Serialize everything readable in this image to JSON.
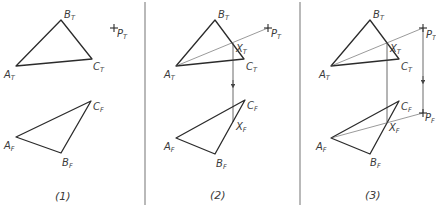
{
  "figure": {
    "panels": [
      {
        "caption": "(1)",
        "top_view": {
          "A": {
            "label": "A",
            "sub": "T"
          },
          "B": {
            "label": "B",
            "sub": "T"
          },
          "C": {
            "label": "C",
            "sub": "T"
          },
          "P": {
            "label": "P",
            "sub": "T"
          }
        },
        "front_view": {
          "A": {
            "label": "A",
            "sub": "F"
          },
          "B": {
            "label": "B",
            "sub": "F"
          },
          "C": {
            "label": "C",
            "sub": "F"
          }
        }
      },
      {
        "caption": "(2)",
        "top_view": {
          "A": {
            "label": "A",
            "sub": "T"
          },
          "B": {
            "label": "B",
            "sub": "T"
          },
          "C": {
            "label": "C",
            "sub": "T"
          },
          "P": {
            "label": "P",
            "sub": "T"
          },
          "X": {
            "label": "X",
            "sub": "T"
          }
        },
        "front_view": {
          "A": {
            "label": "A",
            "sub": "F"
          },
          "B": {
            "label": "B",
            "sub": "F"
          },
          "C": {
            "label": "C",
            "sub": "F"
          },
          "X": {
            "label": "X",
            "sub": "F"
          }
        }
      },
      {
        "caption": "(3)",
        "top_view": {
          "A": {
            "label": "A",
            "sub": "T"
          },
          "B": {
            "label": "B",
            "sub": "T"
          },
          "C": {
            "label": "C",
            "sub": "T"
          },
          "P": {
            "label": "P",
            "sub": "T"
          },
          "X": {
            "label": "X",
            "sub": "T"
          }
        },
        "front_view": {
          "A": {
            "label": "A",
            "sub": "F"
          },
          "B": {
            "label": "B",
            "sub": "F"
          },
          "C": {
            "label": "C",
            "sub": "F"
          },
          "X": {
            "label": "X",
            "sub": "F"
          },
          "P": {
            "label": "P",
            "sub": "F"
          }
        }
      }
    ],
    "colors": {
      "line": "#2b2b2b",
      "divider": "#8a8a8a",
      "background": "#ffffff"
    }
  }
}
